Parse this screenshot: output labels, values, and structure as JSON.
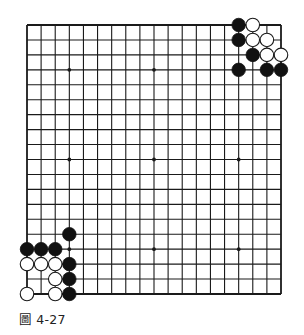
{
  "diagram": {
    "type": "go-board",
    "size": 19,
    "caption": "圖 4-27",
    "colors": {
      "background": "#ffffff",
      "line": "#1a1a1a",
      "black_stone": "#111111",
      "white_stone_fill": "#ffffff",
      "white_stone_stroke": "#1a1a1a"
    },
    "star_points": [
      [
        3,
        3
      ],
      [
        9,
        3
      ],
      [
        15,
        3
      ],
      [
        3,
        9
      ],
      [
        9,
        9
      ],
      [
        15,
        9
      ],
      [
        3,
        15
      ],
      [
        9,
        15
      ],
      [
        15,
        15
      ]
    ],
    "stones": [
      {
        "color": "black",
        "col": 15,
        "row": 0
      },
      {
        "color": "white",
        "col": 16,
        "row": 0
      },
      {
        "color": "black",
        "col": 15,
        "row": 1
      },
      {
        "color": "white",
        "col": 16,
        "row": 1
      },
      {
        "color": "white",
        "col": 17,
        "row": 1
      },
      {
        "color": "black",
        "col": 16,
        "row": 2
      },
      {
        "color": "white",
        "col": 17,
        "row": 2
      },
      {
        "color": "white",
        "col": 18,
        "row": 2
      },
      {
        "color": "black",
        "col": 15,
        "row": 3
      },
      {
        "color": "black",
        "col": 17,
        "row": 3
      },
      {
        "color": "black",
        "col": 18,
        "row": 3
      },
      {
        "color": "black",
        "col": 3,
        "row": 14
      },
      {
        "color": "black",
        "col": 0,
        "row": 15
      },
      {
        "color": "black",
        "col": 1,
        "row": 15
      },
      {
        "color": "black",
        "col": 2,
        "row": 15
      },
      {
        "color": "white",
        "col": 0,
        "row": 16
      },
      {
        "color": "white",
        "col": 1,
        "row": 16
      },
      {
        "color": "white",
        "col": 2,
        "row": 16
      },
      {
        "color": "black",
        "col": 3,
        "row": 16
      },
      {
        "color": "white",
        "col": 2,
        "row": 17
      },
      {
        "color": "black",
        "col": 3,
        "row": 17
      },
      {
        "color": "white",
        "col": 0,
        "row": 18
      },
      {
        "color": "white",
        "col": 2,
        "row": 18
      },
      {
        "color": "black",
        "col": 3,
        "row": 18
      }
    ]
  }
}
